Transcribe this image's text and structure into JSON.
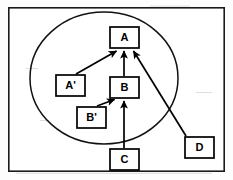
{
  "figure": {
    "kind": "node-link-diagram",
    "background_color": "#fdfdfd",
    "line_color": "#000000",
    "frame": {
      "label": "outer-border",
      "x": 8,
      "y": 7,
      "width": 217,
      "height": 165
    },
    "group_region": {
      "label": "grouping-ellipse",
      "center_x": 104,
      "center_y": 78,
      "radius_x": 74,
      "radius_y": 66
    },
    "nodes": [
      {
        "id": "A",
        "label": "A",
        "x": 110,
        "y": 27,
        "width": 29,
        "height": 21,
        "inside_group": true
      },
      {
        "id": "Aprime",
        "label": "A'",
        "x": 56,
        "y": 75,
        "width": 29,
        "height": 21,
        "inside_group": true
      },
      {
        "id": "B",
        "label": "B",
        "x": 110,
        "y": 77,
        "width": 29,
        "height": 21,
        "inside_group": true
      },
      {
        "id": "Bprime",
        "label": "B'",
        "x": 77,
        "y": 107,
        "width": 29,
        "height": 21,
        "inside_group": true
      },
      {
        "id": "C",
        "label": "C",
        "x": 110,
        "y": 149,
        "width": 29,
        "height": 21,
        "inside_group": false
      },
      {
        "id": "D",
        "label": "D",
        "x": 185,
        "y": 137,
        "width": 29,
        "height": 21,
        "inside_group": false
      }
    ],
    "edges": [
      {
        "id": "edge-aprime-a",
        "from": "Aprime",
        "to": "A",
        "arrowhead": "target",
        "x1": 76,
        "y1": 74,
        "x2": 116,
        "y2": 50
      },
      {
        "id": "edge-b-a",
        "from": "B",
        "to": "A",
        "arrowhead": "target",
        "x1": 124,
        "y1": 76,
        "x2": 124,
        "y2": 50
      },
      {
        "id": "edge-d-a",
        "from": "D",
        "to": "A",
        "arrowhead": "target",
        "x1": 186,
        "y1": 136,
        "x2": 134,
        "y2": 50
      },
      {
        "id": "edge-bprime-b",
        "from": "Bprime",
        "to": "B",
        "arrowhead": "target",
        "x1": 98,
        "y1": 106,
        "x2": 115,
        "y2": 100
      },
      {
        "id": "edge-c-b",
        "from": "C",
        "to": "B",
        "arrowhead": "target",
        "x1": 124,
        "y1": 148,
        "x2": 124,
        "y2": 100
      }
    ]
  }
}
